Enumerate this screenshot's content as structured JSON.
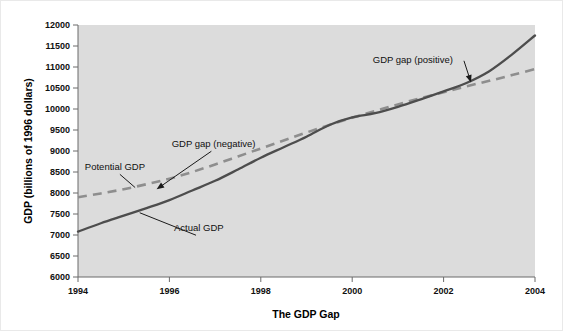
{
  "chart_data": {
    "type": "line",
    "title": "The GDP Gap",
    "xlabel": "The GDP Gap",
    "ylabel": "GDP (billions of 1996 dollars)",
    "xlim": [
      1994,
      2004
    ],
    "ylim": [
      6000,
      12000
    ],
    "grid": false,
    "legend": "none",
    "x_tick_labels": [
      "1994",
      "1996",
      "1998",
      "2000",
      "2002",
      "2004"
    ],
    "x_ticks": [
      1994,
      1996,
      1998,
      2000,
      2002,
      2004
    ],
    "y_tick_labels": [
      "12000",
      "11500",
      "11000",
      "10500",
      "10000",
      "9500",
      "9000",
      "8500",
      "8000",
      "7500",
      "7000",
      "6500",
      "6000"
    ],
    "y_ticks": [
      12000,
      11500,
      11000,
      10500,
      10000,
      9500,
      9000,
      8500,
      8000,
      7500,
      7000,
      6500,
      6000
    ],
    "x": [
      1994,
      1994.5,
      1995,
      1995.5,
      1996,
      1996.5,
      1997,
      1997.5,
      1998,
      1998.5,
      1999,
      1999.5,
      2000,
      2000.5,
      2001,
      2001.5,
      2002,
      2002.5,
      2003,
      2003.5,
      2004
    ],
    "series": [
      {
        "name": "Actual GDP",
        "style": "solid",
        "color": "#4d4d4d",
        "values": [
          7080,
          7280,
          7460,
          7640,
          7830,
          8060,
          8290,
          8560,
          8840,
          9090,
          9340,
          9620,
          9800,
          9900,
          10050,
          10230,
          10420,
          10620,
          10900,
          11300,
          11750
        ]
      },
      {
        "name": "Potential GDP",
        "style": "dashed",
        "color": "#8e8e8e",
        "values": [
          7900,
          7990,
          8090,
          8210,
          8340,
          8500,
          8680,
          8870,
          9060,
          9250,
          9440,
          9620,
          9790,
          9950,
          10110,
          10260,
          10400,
          10540,
          10670,
          10810,
          10950
        ]
      }
    ],
    "annotations": [
      {
        "text": "Potential GDP",
        "label_x": 1994.15,
        "label_y": 8540,
        "target_x": 1995.25,
        "target_y": 8130
      },
      {
        "text": "GDP gap (negative)",
        "label_x": 1996.05,
        "label_y": 9090,
        "target_x": 1995.72,
        "target_y": 8090
      },
      {
        "text": "Actual GDP",
        "label_x": 1996.1,
        "label_y": 7090,
        "target_x": 1995.35,
        "target_y": 7530
      },
      {
        "text": "GDP gap (positive)",
        "label_x": 2000.45,
        "label_y": 11100,
        "target_x": 2002.6,
        "target_y": 10630
      }
    ]
  },
  "colors": {
    "plot_background": "#dcdcdc",
    "page_background": "#ffffff",
    "actual_series": "#4d4d4d",
    "potential_series": "#8e8e8e",
    "axis": "#6b6b6b",
    "text": "#101010"
  }
}
